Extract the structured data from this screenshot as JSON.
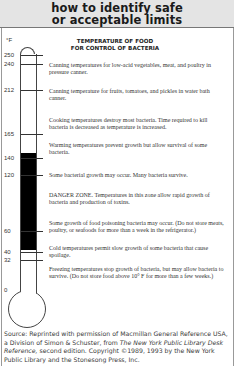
{
  "header": {
    "line1": "how to identify safe",
    "line2": "or acceptable limits"
  },
  "chart": {
    "unit": "°F",
    "title_line1": "TEMPERATURE OF FOOD",
    "title_line2": "FOR CONTROL OF BACTERIA",
    "ticks": [
      {
        "label": "250",
        "y": 55
      },
      {
        "label": "240",
        "y": 64
      },
      {
        "label": "212",
        "y": 90
      },
      {
        "label": "165",
        "y": 134
      },
      {
        "label": "140",
        "y": 158
      },
      {
        "label": "120",
        "y": 175
      },
      {
        "label": "60",
        "y": 231
      },
      {
        "label": "40",
        "y": 252
      },
      {
        "label": "32",
        "y": 260
      },
      {
        "label": "0",
        "y": 290
      }
    ],
    "danger_zone": {
      "from_f": 40,
      "to_f": 140,
      "color": "#000000"
    },
    "descriptions": [
      {
        "text": "Canning temperatures for low-acid vegetables, meat, and poultry in pressure canner.",
        "y": 62
      },
      {
        "text": "Canning temperature for fruits, tomatoes, and pickles in water bath canner.",
        "y": 88
      },
      {
        "text": "Cooking temperatures destroy most bacteria. Time required to kill bacteria is decreased as temperature is increased.",
        "y": 117
      },
      {
        "text": "Warming temperatures prevent growth but allow survival of some bacteria.",
        "y": 142
      },
      {
        "text": "Some bacterial growth may occur. Many bacteria survive.",
        "y": 172
      },
      {
        "text": "DANGER ZONE. Temperatures in this zone allow rapid growth of bacteria and production of toxins.",
        "y": 192
      },
      {
        "text": "Some growth of food poisoning bacteria may occur. (Do not store meats, poultry, or seafoods for more than a week in the refrigerator.)",
        "y": 220
      },
      {
        "text": "Cold temperatures permit slow growth of some bacteria that cause spoilage.",
        "y": 245
      },
      {
        "text": "Freezing temperatures stop growth of bacteria, but may allow bacteria to survive. (Do not store food above 10° F for more than a few weeks.)",
        "y": 266
      }
    ]
  },
  "source": {
    "prefix": "Source: Reprinted with permission of Macmillan General Reference USA, a Division of Simon & Schuster, from ",
    "title": "The New York Public Library Desk Reference,",
    "suffix": " second edition. Copyright ©1989, 1993 by the New York Public Library and the Stonesong Press, Inc."
  }
}
